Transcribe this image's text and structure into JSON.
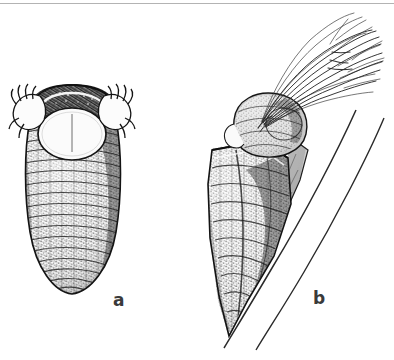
{
  "figure": {
    "kind": "scientific-line-drawing",
    "technique": "pen-and-ink stipple and hatching",
    "background_color": "#ffffff",
    "ink_color": "#2b2b2b",
    "width_px": 394,
    "height_px": 360,
    "scan_rule_color": "#9a9a9a"
  },
  "panels": [
    {
      "id": "a",
      "label": "a",
      "label_position": {
        "x": 113,
        "y": 292
      },
      "subject": "pupal case, ventral view",
      "description": "Elongate ovoid cocoon shown head-on and upright; dark arched hood at the top, a large pale oval operculum with a faint median line, a pair of pale hooked claw-like appendages flanking the opening, and a densely hatched tapering body.",
      "bounds": {
        "x": 8,
        "y": 86,
        "width": 122,
        "height": 216
      },
      "parts": [
        "dark arched hood",
        "pale oval operculum",
        "median line on operculum",
        "left hooked appendage",
        "right hooked appendage",
        "hatched ovoid body",
        "rounded posterior tip"
      ]
    },
    {
      "id": "b",
      "label": "b",
      "label_position": {
        "x": 313,
        "y": 290
      },
      "subject": "pupal case attached to a stem, lateral view",
      "description": "Wedge-shaped case obliquely attached to a slender twig, with a rounded anterior lobe and a dense tuft of long filaments emerging and sweeping up to the right.",
      "bounds": {
        "x": 200,
        "y": 18,
        "width": 190,
        "height": 330
      },
      "parts": [
        "filament tuft",
        "anterior rounded lobe",
        "case body with hatched texture",
        "attachment flange",
        "twig near line",
        "twig far line"
      ]
    }
  ],
  "accessible_caption": "Two pen-and-ink drawings of an insect pupal case: a, ventral view of the closed case showing the pale operculum and paired hooked appendages; b, lateral view of the case fastened to a stem with a tuft of long filaments projecting from the anterior end."
}
